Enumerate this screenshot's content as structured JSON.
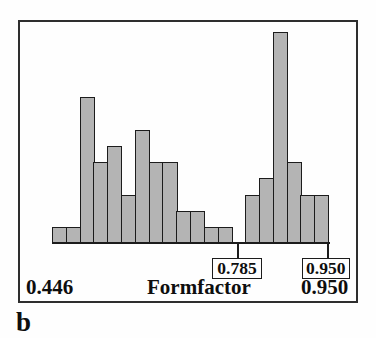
{
  "figure_label": "b",
  "chart_data": {
    "type": "bar",
    "subtype": "histogram",
    "title": "",
    "xlabel": "Formfactor",
    "ylabel": "",
    "x_min": 0.446,
    "x_max": 0.95,
    "x_range_labels": {
      "min": "0.446",
      "max": "0.950"
    },
    "bins": 20,
    "bin_width": 0.0252,
    "counts": [
      1,
      1,
      9,
      5,
      6,
      3,
      7,
      5,
      5,
      2,
      2,
      1,
      1,
      0,
      3,
      4,
      13,
      5,
      3,
      3
    ],
    "ylim": [
      0,
      13
    ],
    "grid": false,
    "legend": false,
    "callouts": [
      {
        "label": "0.785",
        "x_value": 0.785
      },
      {
        "label": "0.950",
        "x_value": 0.95
      }
    ],
    "colors": {
      "bar_fill": "#b4b4b4",
      "bar_border": "#1c1c1c",
      "frame": "#2e2e2e",
      "text": "#0e0e0e",
      "background": "#fefefe"
    }
  }
}
